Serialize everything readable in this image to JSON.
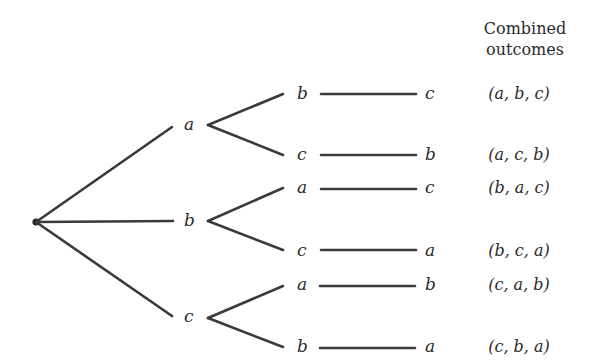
{
  "diagram": {
    "header": {
      "line1": "Combined",
      "line2": "outcomes"
    },
    "root": {
      "name": "start"
    },
    "levels": [
      {
        "label": "a",
        "children": [
          {
            "label": "b",
            "leaf": "c",
            "outcome": "(a, b, c)"
          },
          {
            "label": "c",
            "leaf": "b",
            "outcome": "(a, c, b)"
          }
        ]
      },
      {
        "label": "b",
        "children": [
          {
            "label": "a",
            "leaf": "c",
            "outcome": "(b, a, c)"
          },
          {
            "label": "c",
            "leaf": "a",
            "outcome": "(b, c, a)"
          }
        ]
      },
      {
        "label": "c",
        "children": [
          {
            "label": "a",
            "leaf": "b",
            "outcome": "(c, a, b)"
          },
          {
            "label": "b",
            "leaf": "a",
            "outcome": "(c, b, a)"
          }
        ]
      }
    ],
    "colors": {
      "line": "#3a3a3a",
      "text": "#2a2a2a",
      "background": "#ffffff"
    }
  }
}
